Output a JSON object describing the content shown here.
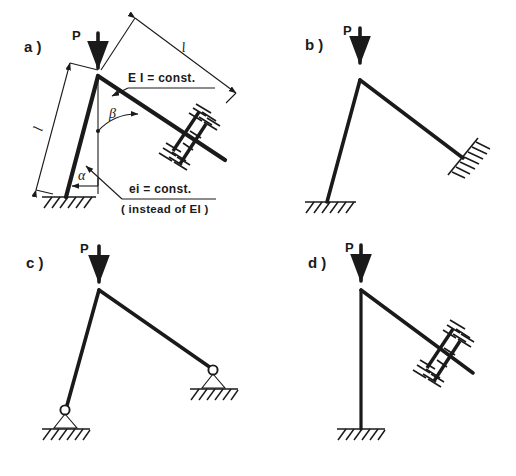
{
  "figure": {
    "type": "engineering-diagram",
    "background": "#ffffff",
    "ink_color": "#1a1a1a"
  },
  "panels": [
    {
      "id": "a",
      "label": "a )",
      "load_label": "P",
      "annotations": {
        "column_length": "l",
        "beam_length": "l",
        "beam_angle": "β",
        "column_angle": "α",
        "beam_stiffness": "E I = const.",
        "column_stiffness": "ei = const.",
        "column_stiffness_note": "( instead of EI )"
      },
      "supports": {
        "column_base": "fixed-hatched",
        "beam_end": "guided-sliding"
      }
    },
    {
      "id": "b",
      "label": "b )",
      "load_label": "P",
      "supports": {
        "column_base": "fixed-hatched",
        "beam_end": "fixed-hatched-inclined"
      }
    },
    {
      "id": "c",
      "label": "c )",
      "load_label": "P",
      "supports": {
        "column_base": "pinned",
        "beam_end": "pinned"
      }
    },
    {
      "id": "d",
      "label": "d )",
      "load_label": "P",
      "supports": {
        "column_base": "fixed-hatched",
        "beam_end": "guided-sliding"
      }
    }
  ],
  "icons": {
    "load_arrow": "down-arrow-icon",
    "fixed_support": "fixed-support-icon",
    "pin_support": "pin-support-icon",
    "guided_support": "guided-support-icon",
    "dimension_arrow": "dimension-arrow-icon",
    "angle_arc": "angle-arc-icon"
  }
}
